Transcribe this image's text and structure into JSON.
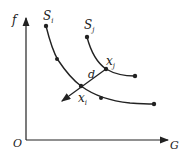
{
  "axes": {
    "y_label": "f",
    "x_label": "G",
    "origin_label": "O"
  },
  "curves": [
    {
      "name": "S_i",
      "label": "S",
      "subscript": "i"
    },
    {
      "name": "S_j",
      "label": "S",
      "subscript": "j"
    }
  ],
  "points": {
    "xi_label": "x",
    "xi_sub": "i",
    "xj_label": "x",
    "xj_sub": "j",
    "distance_label": "d"
  },
  "colors": {
    "stroke": "#222222",
    "background": "#ffffff"
  }
}
